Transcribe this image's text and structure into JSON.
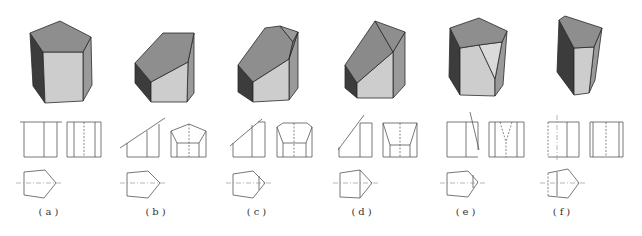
{
  "colors": {
    "top": "#8e8e8e",
    "left": "#3c3c3c",
    "front": "#cdcdcd",
    "right": "#9a9a9a",
    "cut": "#8a8a8a",
    "cut_light": "#dadada",
    "edge": "#2a2a2a",
    "line": "#555555",
    "center_line": "#888888"
  },
  "figures": [
    {
      "id": "a",
      "label": "(a)",
      "label_x": 50,
      "solid": [
        {
          "face": "left",
          "pts": "30,33 43,52 45,103 33,86"
        },
        {
          "face": "right",
          "pts": "83,52 91,37 92,85 83,101"
        },
        {
          "face": "front",
          "pts": "43,52 83,52 83,101 45,103"
        },
        {
          "face": "top",
          "pts": "60,21 91,37 83,52 43,52 30,33"
        }
      ],
      "lines": [
        "20,122 62,122",
        "24,122 24,157",
        "57,122 57,157",
        "24,157 57,157",
        "44,122 44,157",
        "67,122 101,122",
        "67,157 101,157",
        "67,122 67,157",
        "101,122 101,157",
        "74,122 74,157",
        "95,122 95,157",
        "24,172 45,170",
        "45,170 56,183",
        "56,183 44,198",
        "44,198 24,195",
        "24,195 24,172"
      ],
      "dashed": [
        "84,122 84,157"
      ],
      "center": [
        "16,183 63,183"
      ]
    },
    {
      "id": "b",
      "label": "(b)",
      "label_x": 157,
      "solid": [
        {
          "face": "left",
          "pts": "135,63 151,82 151,102 135,83"
        },
        {
          "face": "right",
          "pts": "188,62 194,33 194,93 187,102"
        },
        {
          "face": "front",
          "pts": "151,82 188,62 187,102 151,102"
        },
        {
          "face": "top",
          "pts": "163,33 194,33 188,62 151,82 135,63"
        }
      ],
      "lines": [
        "120,148 165,118",
        "127,143 127,157",
        "127,157 159,157",
        "159,124 159,157",
        "147,131 147,157",
        "171,131 189,124",
        "189,124 206,131",
        "171,131 171,157",
        "206,131 206,157",
        "171,157 206,157",
        "171,131 177,143",
        "206,131 199,143",
        "177,143 199,143",
        "177,143 177,157",
        "199,143 199,157",
        "127,173 148,171",
        "148,171 160,183",
        "160,183 148,198",
        "148,198 127,196",
        "127,196 127,173"
      ],
      "dashed": [
        "189,124 189,157"
      ],
      "center": [
        "120,183 167,183"
      ]
    },
    {
      "id": "c",
      "label": "(c)",
      "label_x": 258,
      "solid": [
        {
          "face": "left",
          "pts": "238,65 253,82 253,102 238,92"
        },
        {
          "face": "right",
          "pts": "289,59 298,32 298,88 289,100"
        },
        {
          "face": "front",
          "pts": "253,82 289,59 289,100 253,102"
        },
        {
          "face": "top",
          "pts": "265,28 280,26 293,42 289,59 253,82 238,65"
        },
        {
          "face": "right",
          "pts": "280,26 298,32 293,42"
        },
        {
          "face": "cut",
          "pts": "293,42 298,32 289,59"
        }
      ],
      "lines": [
        "230,146 262,119",
        "233,143 233,157",
        "233,157 265,157",
        "265,122 265,157",
        "258,122 265,122",
        "252,125 252,157",
        "283,123 307,123",
        "283,123 277,127",
        "307,123 312,127",
        "277,127 277,157",
        "312,127 312,157",
        "277,157 312,157",
        "277,127 283,143",
        "312,127 306,143",
        "283,143 306,143",
        "283,143 283,157",
        "306,143 306,157",
        "233,174 253,171",
        "253,171 265,183",
        "265,183 253,198",
        "253,198 233,195",
        "233,195 233,174",
        "259,176 259,190"
      ],
      "dashed": [
        "294,123 294,157"
      ],
      "center": [
        "226,183 272,183"
      ]
    },
    {
      "id": "d",
      "label": "(d)",
      "label_x": 363,
      "solid": [
        {
          "face": "left",
          "pts": "345,65 357,83 357,98 345,88"
        },
        {
          "face": "right",
          "pts": "393,52 405,32 405,85 393,98"
        },
        {
          "face": "front",
          "pts": "357,83 393,52 393,98 357,98"
        },
        {
          "face": "cut",
          "pts": "375,21 393,52 357,83 345,65"
        },
        {
          "face": "top",
          "pts": "375,21 405,32 393,52"
        }
      ],
      "lines": [
        "338,150 364,115",
        "339,147 339,157",
        "339,157 372,157",
        "372,123 372,157",
        "360,123 372,123",
        "360,123 360,157",
        "383,123 417,123",
        "383,123 383,157",
        "417,123 417,157",
        "383,157 417,157",
        "383,123 390,145",
        "417,123 410,145",
        "390,145 410,145",
        "390,145 390,157",
        "410,145 410,157",
        "340,173 360,170",
        "360,170 372,183",
        "372,183 360,198",
        "360,198 340,197",
        "340,197 340,173",
        "360,170 360,198"
      ],
      "dashed": [
        "400,123 400,157"
      ],
      "center": [
        "333,183 379,183"
      ]
    },
    {
      "id": "e",
      "label": "(e)",
      "label_x": 467,
      "solid": [
        {
          "face": "left",
          "pts": "450,28 460,48 460,95 449,77"
        },
        {
          "face": "front",
          "pts": "460,48 479,45 495,79 495,96 460,95"
        },
        {
          "face": "right",
          "pts": "502,42 507,31 503,85 495,96 495,79"
        },
        {
          "face": "cut_light",
          "pts": "479,45 502,42 495,79"
        },
        {
          "face": "top",
          "pts": "479,18 507,31 502,42 479,45 460,48 450,28"
        }
      ],
      "lines": [
        "447,122 478,122",
        "447,157 478,157",
        "447,122 447,157",
        "478,122 478,143",
        "466,122 466,157",
        "470,112 479,150",
        "478,143 478,150",
        "489,122 524,122",
        "489,157 524,157",
        "489,122 489,157",
        "524,122 524,157",
        "495,122 495,157",
        "517,122 517,157",
        "447,173 468,171",
        "468,171 478,182",
        "478,182 468,197",
        "468,197 447,195",
        "447,195 447,173",
        "473,175 473,188"
      ],
      "dashed": [
        "500,122 506,142",
        "512,122 506,142",
        "506,142 506,157"
      ],
      "center": [
        "440,183 486,183"
      ]
    },
    {
      "id": "f",
      "label": "(f)",
      "label_x": 563,
      "solid": [
        {
          "face": "left",
          "pts": "559,20 574,48 574,95 557,72"
        },
        {
          "face": "right",
          "pts": "594,47 602,28 595,80 589,93"
        },
        {
          "face": "front",
          "pts": "574,48 594,47 589,93 574,95"
        },
        {
          "face": "top",
          "pts": "559,20 565,16 602,28 594,47 574,48"
        }
      ],
      "lines": [
        "548,122 579,122",
        "548,157 579,157",
        "579,122 579,157",
        "567,122 567,157",
        "590,122 623,122",
        "590,157 623,157",
        "590,122 590,157",
        "623,122 623,157",
        "593,122 593,157",
        "619,122 619,157",
        "548,173 568,169",
        "568,169 579,183",
        "579,183 568,198",
        "568,198 548,196",
        "557,172 557,196"
      ],
      "dashed": [
        "548,122 548,157",
        "606,122 606,157",
        "548,173 548,196"
      ],
      "center": [
        "557,115 557,160",
        "540,183 586,183"
      ]
    }
  ]
}
